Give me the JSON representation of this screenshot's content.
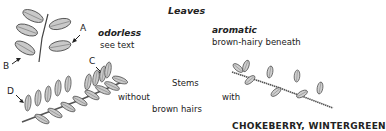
{
  "diagram": {
    "title": "Leaves",
    "left_leaf": {
      "descriptor": "odorless",
      "note": "see text"
    },
    "right_leaf": {
      "descriptor": "aromatic",
      "note": "brown-hairy beneath"
    },
    "stems_label": "Stems",
    "stem_without": "without",
    "stem_with": "with",
    "stem_hairs": "brown hairs",
    "markers": [
      "A",
      "B",
      "C",
      "D"
    ],
    "cut_heading": "CHOKEBERRY, WINTERGREEN"
  }
}
